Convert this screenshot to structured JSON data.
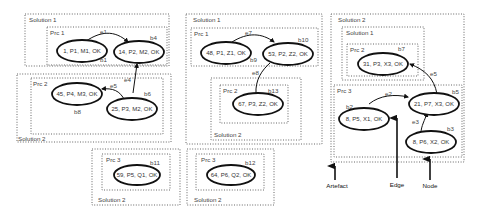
{
  "boxes": {
    "p1_solution1": "Solution 1",
    "p1_prc1": "Prc 1",
    "p1_prc2": "Prc 2",
    "p1_solution2": "Solution 2",
    "p1b_prc3": "Prc 3",
    "p1b_solution2": "Solution 2",
    "p2_solution1": "Solution 1",
    "p2_prc1": "Prc 1",
    "p2_prc2": "Prc 2",
    "p2_solution2": "Solution 2",
    "p2b_prc3": "Prc 3",
    "p2b_solution2": "Solution 2",
    "p3_solution2": "Solution 2",
    "p3_solution1": "Solution 1",
    "p3_prc2": "Prc 2",
    "p3_prc3": "Prc 3"
  },
  "nodes": {
    "n1": "1, P1, M1, OK",
    "n14": "14, P2, M2, OK",
    "n45": "45, P4, M3, OK",
    "n25": "25, P3, M2, OK",
    "n59": "59, P5, Q1, OK",
    "n48": "48, P1, Z1, OK",
    "n53": "53, P2, Z2, OK",
    "n67": "67, P3, Z2, OK",
    "n64": "64, P6, Q2, OK",
    "n31": "31, P3, X3, OK",
    "n21": "21, P7, X3, OK",
    "n8a": "8, P5, X1, OK",
    "n8b": "8, P6, X2, OK"
  },
  "badges": {
    "b1": "b1",
    "b4": "b4",
    "b6": "b6",
    "b8": "b8",
    "b11": "b11",
    "b9": "b9",
    "b10": "b10",
    "b13": "b13",
    "b12": "b12",
    "b7": "b7",
    "b5": "b5",
    "b2": "b2",
    "b3": "b3"
  },
  "edges": {
    "e1": "e1",
    "e4": "e4",
    "e5": "e5",
    "e7": "e7",
    "e8": "e8",
    "e6": "e6",
    "e2": "e2",
    "e3": "e3"
  },
  "legend": {
    "artefact": "Artefact",
    "edge": "Edge",
    "node": "Node"
  }
}
